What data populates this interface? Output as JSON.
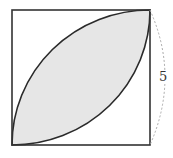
{
  "figure": {
    "type": "geometry-diagram",
    "square": {
      "x": 12,
      "y": 10,
      "width": 138,
      "height": 135,
      "stroke": "#333333"
    },
    "shaded_region": {
      "fill": "#e6e6e6",
      "stroke": "#2a2a2a"
    },
    "dimension": {
      "label": "5",
      "side": "right",
      "style": "dashed-arc",
      "color": "#aaaaaa"
    }
  }
}
